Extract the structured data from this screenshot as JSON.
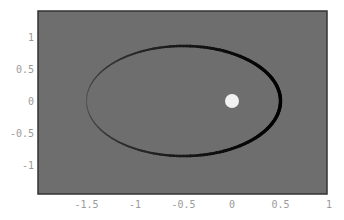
{
  "chart_data": {
    "type": "line",
    "title": "",
    "xlabel": "",
    "ylabel": "",
    "xlim": [
      -1.95,
      1.0
    ],
    "ylim": [
      -1.45,
      1.4
    ],
    "grid": false,
    "legend": null,
    "background_color": "#6e6e6e",
    "x_ticks": [
      {
        "value": -1.5,
        "label": "-1.5"
      },
      {
        "value": -1,
        "label": "-1"
      },
      {
        "value": -0.5,
        "label": "-0.5"
      },
      {
        "value": 0,
        "label": "0"
      },
      {
        "value": 0.5,
        "label": "0.5"
      },
      {
        "value": 1,
        "label": "1"
      }
    ],
    "y_ticks": [
      {
        "value": 1,
        "label": "1"
      },
      {
        "value": 0.5,
        "label": "0.5"
      },
      {
        "value": 0,
        "label": "0"
      },
      {
        "value": -0.5,
        "label": "-0.5"
      },
      {
        "value": -1,
        "label": "-1"
      }
    ],
    "series": [
      {
        "name": "ellipse",
        "kind": "ellipse",
        "center": [
          -0.5,
          0
        ],
        "semi_axis_x": 1.0,
        "semi_axis_y": 0.86,
        "color": "#000000",
        "note": "stroke fades from thin/dark-gray on left side to thick black on right side"
      },
      {
        "name": "point",
        "kind": "marker",
        "x": 0,
        "y": 0,
        "color": "#f2f2f2",
        "size": 7
      }
    ]
  }
}
